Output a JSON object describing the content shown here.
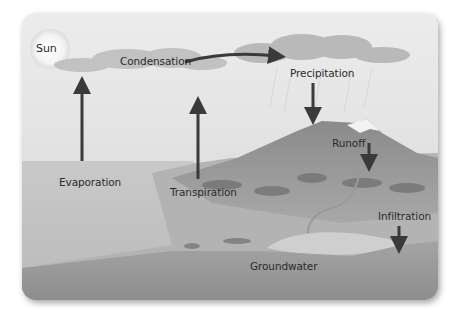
{
  "diagram": {
    "labels": {
      "sun": "Sun",
      "condensation": "Condensation",
      "precipitation": "Precipitation",
      "runoff": "Runoff",
      "evaporation": "Evaporation",
      "transpiration": "Transpiration",
      "infiltration": "Infiltration",
      "groundwater": "Groundwater"
    },
    "colors": {
      "arrow": "#3a3a3a",
      "sky": "#ececec",
      "water": "#bdbdbd",
      "mountain": "#8c8c8c",
      "groundwater": "#9a9a9a",
      "cloud": "#b8b8b8"
    }
  }
}
